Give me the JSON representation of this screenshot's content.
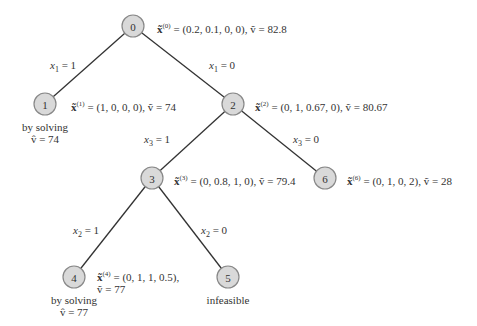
{
  "diagram": {
    "type": "branch-and-bound tree",
    "node_fill": "#d9d9d9",
    "node_stroke": "#888888",
    "edge_color": "#333333",
    "nodes": [
      {
        "id": "0",
        "cx": 133,
        "cy": 26
      },
      {
        "id": "1",
        "cx": 45,
        "cy": 104
      },
      {
        "id": "2",
        "cx": 233,
        "cy": 104
      },
      {
        "id": "3",
        "cx": 152,
        "cy": 178
      },
      {
        "id": "6",
        "cx": 325,
        "cy": 178
      },
      {
        "id": "4",
        "cx": 74,
        "cy": 277
      },
      {
        "id": "5",
        "cx": 228,
        "cy": 277
      }
    ],
    "edges": [
      {
        "from": "0",
        "to": "1",
        "var": "x",
        "sub": "1",
        "eq": " = 1"
      },
      {
        "from": "0",
        "to": "2",
        "var": "x",
        "sub": "1",
        "eq": " = 0"
      },
      {
        "from": "2",
        "to": "3",
        "var": "x",
        "sub": "3",
        "eq": " = 1"
      },
      {
        "from": "2",
        "to": "6",
        "var": "x",
        "sub": "3",
        "eq": " = 0"
      },
      {
        "from": "3",
        "to": "4",
        "var": "x",
        "sub": "2",
        "eq": " = 1"
      },
      {
        "from": "3",
        "to": "5",
        "var": "x",
        "sub": "2",
        "eq": " = 0"
      }
    ],
    "annotations": {
      "n0": {
        "sup": "(0)",
        "vec": " = (0.2, 0.1, 0, 0),  ",
        "val": "ṽ = 82.8"
      },
      "n1": {
        "sup": "(1)",
        "vec": " = (1, 0, 0, 0),  ",
        "val": "ṽ = 74"
      },
      "n2": {
        "sup": "(2)",
        "vec": " = (0, 1, 0.67, 0),  ",
        "val": "ṽ = 80.67"
      },
      "n3": {
        "sup": "(3)",
        "vec": " = (0, 0.8, 1, 0),   ",
        "val": "ṽ = 79.4"
      },
      "n6": {
        "sup": "(6)",
        "vec": " = (0, 1, 0, 2),  ",
        "val": "ṽ = 28"
      },
      "n4": {
        "sup": "(4)",
        "vec": " = (0, 1, 1, 0.5),",
        "val": "ṽ = 77"
      }
    },
    "x_symbol": "x̃",
    "notes": {
      "n1_line1": "by solving",
      "n1_line2": "v̂ = 74",
      "n4_line1": "by solving",
      "n4_line2": "v̂ = 77",
      "n5_line1": "infeasible"
    }
  }
}
